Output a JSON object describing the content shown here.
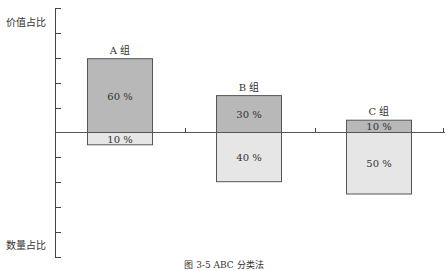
{
  "chart_data": {
    "type": "bar",
    "subtype": "diverging-stacked",
    "title": "",
    "caption": "图 3-5 ABC 分类法",
    "ylabel_top": "价值占比",
    "ylabel_bottom": "数量占比",
    "categories": [
      "A 组",
      "B 组",
      "C 组"
    ],
    "series": [
      {
        "name": "价值占比",
        "direction": "up",
        "color": "#b8b8b8",
        "values": [
          60,
          30,
          10
        ],
        "labels": [
          "60 %",
          "30 %",
          "10 %"
        ]
      },
      {
        "name": "数量占比",
        "direction": "down",
        "color": "#e6e6e6",
        "values": [
          10,
          40,
          50
        ],
        "labels": [
          "10 %",
          "40 %",
          "50 %"
        ]
      }
    ],
    "ylim_up": [
      0,
      100
    ],
    "ylim_down": [
      0,
      100
    ],
    "grid": false,
    "legend": "none"
  },
  "labels": {
    "axis_top": "价值占比",
    "axis_bottom": "数量占比",
    "caption": "图 3-5 ABC 分类法"
  }
}
